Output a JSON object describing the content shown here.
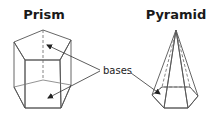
{
  "diagram": {
    "prism": {
      "title": "Prism"
    },
    "pyramid": {
      "title": "Pyramid"
    },
    "callout": {
      "label": "bases"
    },
    "colors": {
      "top_face": "#ececec",
      "front_face": "#bdbdbd",
      "side_face_left": "#e2e2e2",
      "side_face_right": "#a8a8a8",
      "base_face": "#b0b0b0",
      "edge": "#555555",
      "text": "#1a1a1a"
    }
  }
}
